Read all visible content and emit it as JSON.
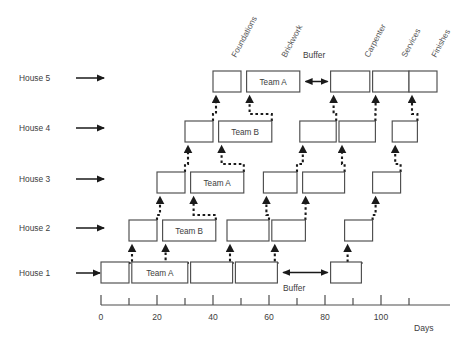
{
  "figure": {
    "type": "line-of-balance-schedule",
    "axis": {
      "label": "Days",
      "ticks_major": [
        0,
        20,
        40,
        60,
        80,
        100
      ],
      "tick_labels": [
        "0",
        "20",
        "40",
        "60",
        "80",
        "100"
      ],
      "tick_minor_step": 10,
      "range": [
        0,
        115
      ]
    },
    "trade_labels": [
      {
        "name": "Foundations",
        "x_day": 45
      },
      {
        "name": "Brickwork",
        "x_day": 63
      },
      {
        "name": "Carpenter",
        "x_day": 93
      },
      {
        "name": "Services",
        "x_day": 106
      },
      {
        "name": "Finishes",
        "x_day": 116
      }
    ],
    "buffer_labels": [
      {
        "text": "Buffer",
        "row": "House 5"
      },
      {
        "text": "Buffer",
        "row": "House 1"
      }
    ],
    "rows": [
      {
        "label": "House 5",
        "bars": [
          {
            "trade": "Foundations",
            "start": 40,
            "end": 50,
            "text": ""
          },
          {
            "trade": "Brickwork",
            "start": 52,
            "end": 71,
            "text": "Team A"
          },
          {
            "trade": "Carpenter",
            "start": 82,
            "end": 96,
            "text": ""
          },
          {
            "trade": "Services",
            "start": 97,
            "end": 110,
            "text": ""
          },
          {
            "trade": "Finishes",
            "start": 110,
            "end": 120,
            "text": ""
          }
        ],
        "buffer": {
          "start": 72,
          "end": 82
        }
      },
      {
        "label": "House 4",
        "bars": [
          {
            "trade": "Foundations",
            "start": 30,
            "end": 40,
            "text": ""
          },
          {
            "trade": "Brickwork",
            "start": 42,
            "end": 61,
            "text": "Team B"
          },
          {
            "trade": "Carpenter",
            "start": 71,
            "end": 84,
            "text": ""
          },
          {
            "trade": "Services",
            "start": 85,
            "end": 98,
            "text": ""
          },
          {
            "trade": "Finishes",
            "start": 104,
            "end": 113,
            "text": ""
          }
        ],
        "buffer": null
      },
      {
        "label": "House 3",
        "bars": [
          {
            "trade": "Foundations",
            "start": 20,
            "end": 30,
            "text": ""
          },
          {
            "trade": "Brickwork",
            "start": 32,
            "end": 51,
            "text": "Team A"
          },
          {
            "trade": "Carpenter",
            "start": 58,
            "end": 70,
            "text": ""
          },
          {
            "trade": "Services",
            "start": 72,
            "end": 87,
            "text": ""
          },
          {
            "trade": "Finishes",
            "start": 97,
            "end": 107,
            "text": ""
          }
        ],
        "buffer": null
      },
      {
        "label": "House 2",
        "bars": [
          {
            "trade": "Foundations",
            "start": 10,
            "end": 20,
            "text": ""
          },
          {
            "trade": "Brickwork",
            "start": 22,
            "end": 41,
            "text": "Team B"
          },
          {
            "trade": "Carpenter",
            "start": 45,
            "end": 60,
            "text": ""
          },
          {
            "trade": "Services",
            "start": 61,
            "end": 73,
            "text": ""
          },
          {
            "trade": "Finishes",
            "start": 87,
            "end": 97,
            "text": ""
          }
        ],
        "buffer": null
      },
      {
        "label": "House 1",
        "bars": [
          {
            "trade": "Foundations",
            "start": 0,
            "end": 10,
            "text": ""
          },
          {
            "trade": "Brickwork",
            "start": 11,
            "end": 31,
            "text": "Team A"
          },
          {
            "trade": "Carpenter",
            "start": 32,
            "end": 47,
            "text": ""
          },
          {
            "trade": "Services",
            "start": 48,
            "end": 63,
            "text": ""
          },
          {
            "trade": "Finishes",
            "start": 82,
            "end": 93,
            "text": ""
          }
        ],
        "buffer": {
          "start": 64,
          "end": 82
        }
      }
    ],
    "colors": {
      "bar_stroke": "#4d4d4d",
      "bar_fill": "#ffffff",
      "dependency": "#1a1a1a",
      "axis": "#4d4d4d",
      "text": "#3d3d3d",
      "rotated_text": "#585858"
    }
  },
  "chart_data": {
    "type": "bar",
    "title": "",
    "xlabel": "Days",
    "ylabel": "",
    "categories": [
      "House 1",
      "House 2",
      "House 3",
      "House 4",
      "House 5"
    ],
    "series": [
      {
        "name": "Foundations",
        "values": [
          [
            0,
            10
          ],
          [
            10,
            20
          ],
          [
            20,
            30
          ],
          [
            30,
            40
          ],
          [
            40,
            50
          ]
        ]
      },
      {
        "name": "Brickwork",
        "values": [
          [
            11,
            31
          ],
          [
            22,
            41
          ],
          [
            32,
            51
          ],
          [
            42,
            61
          ],
          [
            52,
            71
          ]
        ]
      },
      {
        "name": "Carpenter",
        "values": [
          [
            32,
            47
          ],
          [
            45,
            60
          ],
          [
            58,
            70
          ],
          [
            71,
            84
          ],
          [
            82,
            96
          ]
        ]
      },
      {
        "name": "Services",
        "values": [
          [
            48,
            63
          ],
          [
            61,
            73
          ],
          [
            72,
            87
          ],
          [
            85,
            98
          ],
          [
            97,
            110
          ]
        ]
      },
      {
        "name": "Finishes",
        "values": [
          [
            82,
            93
          ],
          [
            87,
            97
          ],
          [
            97,
            107
          ],
          [
            104,
            113
          ],
          [
            110,
            120
          ]
        ]
      }
    ],
    "xlim": [
      0,
      115
    ],
    "grid": false,
    "legend": "none"
  }
}
